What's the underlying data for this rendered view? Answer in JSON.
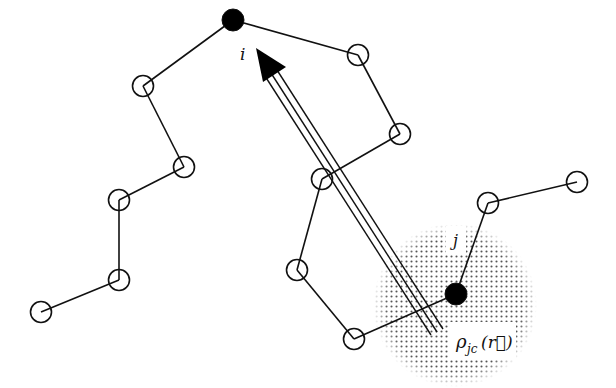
{
  "diagram": {
    "type": "polymer-chain-interaction",
    "colors": {
      "line": "#111111",
      "node_fill_open": "#ffffff",
      "node_fill_solid": "#000000",
      "shading_dot": "#555555",
      "background": "#ffffff"
    },
    "labels": {
      "node_i": "i",
      "node_j": "j",
      "density": "ρ",
      "density_sub": "jc",
      "density_arg": "(r⃗)"
    },
    "nodes": [
      {
        "id": "i",
        "x": 233,
        "y": 20,
        "filled": true
      },
      {
        "id": "L1",
        "x": 143,
        "y": 86,
        "filled": false
      },
      {
        "id": "L2",
        "x": 184,
        "y": 167,
        "filled": false
      },
      {
        "id": "L3",
        "x": 119,
        "y": 200,
        "filled": false
      },
      {
        "id": "L4",
        "x": 119,
        "y": 280,
        "filled": false
      },
      {
        "id": "L5",
        "x": 41,
        "y": 312,
        "filled": false
      },
      {
        "id": "R1",
        "x": 358,
        "y": 55,
        "filled": false
      },
      {
        "id": "R2",
        "x": 400,
        "y": 134,
        "filled": false
      },
      {
        "id": "R3",
        "x": 322,
        "y": 179,
        "filled": false
      },
      {
        "id": "R4",
        "x": 297,
        "y": 270,
        "filled": false
      },
      {
        "id": "R5",
        "x": 354,
        "y": 339,
        "filled": false
      },
      {
        "id": "j",
        "x": 456,
        "y": 294,
        "filled": true
      },
      {
        "id": "R6",
        "x": 488,
        "y": 203,
        "filled": false
      },
      {
        "id": "R7",
        "x": 577,
        "y": 182,
        "filled": false
      }
    ],
    "bonds": [
      [
        "i",
        "L1"
      ],
      [
        "L1",
        "L2"
      ],
      [
        "L2",
        "L3"
      ],
      [
        "L3",
        "L4"
      ],
      [
        "L4",
        "L5"
      ],
      [
        "i",
        "R1"
      ],
      [
        "R1",
        "R2"
      ],
      [
        "R2",
        "R3"
      ],
      [
        "R3",
        "R4"
      ],
      [
        "R4",
        "R5"
      ],
      [
        "R5",
        "j"
      ],
      [
        "j",
        "R6"
      ],
      [
        "R6",
        "R7"
      ]
    ],
    "arrow": {
      "from_x": 437,
      "from_y": 332,
      "to_x": 256,
      "to_y": 50,
      "style": "triple-line"
    },
    "density_cloud": {
      "cx": 455,
      "cy": 305,
      "r": 82
    }
  }
}
